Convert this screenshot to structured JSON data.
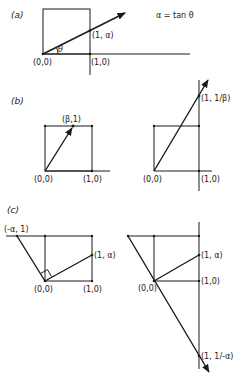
{
  "figure": {
    "panels": [
      {
        "id": "a",
        "label": "(a)",
        "equation": "α = tan θ",
        "angle_label": "θ",
        "points": {
          "origin": "(0,0)",
          "unit_x": "(1,0)",
          "intersect": "(1, α)"
        }
      },
      {
        "id": "b",
        "label": "(b)",
        "left": {
          "origin": "(0,0)",
          "unit_x": "(1,0)",
          "top_point": "(β,1)"
        },
        "right": {
          "origin": "(0,0)",
          "unit_x": "(1,0)",
          "intersect": "(1, 1/β)"
        }
      },
      {
        "id": "c",
        "label": "(c)",
        "left": {
          "origin": "(0,0)",
          "unit_x": "(1,0)",
          "top_left": "(-α, 1)",
          "right_point": "(1, α)"
        },
        "right": {
          "origin": "(0,0)",
          "unit_x": "(1,0)",
          "upper_point": "(1, α)",
          "lower_point": "(1, 1/-α)"
        }
      }
    ]
  }
}
